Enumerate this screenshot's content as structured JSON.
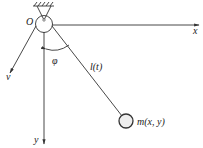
{
  "diagram": {
    "labels": {
      "origin": "O",
      "x_axis": "x",
      "y_axis": "y",
      "velocity": "v",
      "angle": "φ",
      "length": "l(t)",
      "mass": "m(x, y)"
    },
    "colors": {
      "stroke": "#333333",
      "bob_fill": "#eeeeee",
      "background": "#ffffff"
    }
  }
}
